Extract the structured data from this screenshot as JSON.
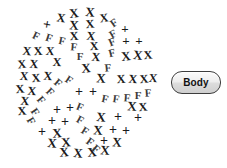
{
  "figure": {
    "name": "circular-glyph-cluster",
    "background_color": "#ffffff",
    "ink_color": "#1a1a1a",
    "cluster": {
      "center_x": 84,
      "center_y": 84,
      "radius": 74,
      "description": "circular field of hand-drawn glyphs arranged along spiral arcs"
    },
    "glyph_legend": [
      {
        "key": "x",
        "symbol": "X",
        "name": "x-glyph"
      },
      {
        "key": "p",
        "symbol": "+",
        "name": "plus-glyph"
      },
      {
        "key": "f",
        "symbol": "F",
        "name": "f-glyph"
      }
    ],
    "glyphs": [
      {
        "t": "x",
        "x": 74,
        "y": 13,
        "s": 13,
        "r": -6
      },
      {
        "t": "x",
        "x": 90,
        "y": 12,
        "s": 13,
        "r": 5
      },
      {
        "t": "x",
        "x": 61,
        "y": 18,
        "s": 12,
        "r": 8
      },
      {
        "t": "x",
        "x": 104,
        "y": 18,
        "s": 12,
        "r": -8
      },
      {
        "t": "x",
        "x": 74,
        "y": 25,
        "s": 13,
        "r": 4
      },
      {
        "t": "x",
        "x": 90,
        "y": 24,
        "s": 12,
        "r": -5
      },
      {
        "t": "p",
        "x": 47,
        "y": 25,
        "s": 14,
        "r": 10
      },
      {
        "t": "f",
        "x": 114,
        "y": 23,
        "s": 11,
        "r": -35
      },
      {
        "t": "x",
        "x": 74,
        "y": 36,
        "s": 12,
        "r": -4
      },
      {
        "t": "x",
        "x": 91,
        "y": 36,
        "s": 12,
        "r": 6
      },
      {
        "t": "f",
        "x": 113,
        "y": 34,
        "s": 11,
        "r": -30
      },
      {
        "t": "p",
        "x": 125,
        "y": 28,
        "s": 13,
        "r": 0
      },
      {
        "t": "f",
        "x": 36,
        "y": 36,
        "s": 11,
        "r": 25
      },
      {
        "t": "f",
        "x": 49,
        "y": 38,
        "s": 11,
        "r": 18
      },
      {
        "t": "f",
        "x": 62,
        "y": 41,
        "s": 11,
        "r": 12
      },
      {
        "t": "x",
        "x": 94,
        "y": 46,
        "s": 12,
        "r": -3
      },
      {
        "t": "f",
        "x": 74,
        "y": 47,
        "s": 11,
        "r": 5
      },
      {
        "t": "f",
        "x": 112,
        "y": 42,
        "s": 11,
        "r": -22
      },
      {
        "t": "p",
        "x": 126,
        "y": 40,
        "s": 13,
        "r": 0
      },
      {
        "t": "p",
        "x": 139,
        "y": 40,
        "s": 13,
        "r": 0
      },
      {
        "t": "x",
        "x": 27,
        "y": 51,
        "s": 12,
        "r": 6
      },
      {
        "t": "x",
        "x": 38,
        "y": 51,
        "s": 12,
        "r": -4
      },
      {
        "t": "x",
        "x": 50,
        "y": 51,
        "s": 12,
        "r": 4
      },
      {
        "t": "f",
        "x": 80,
        "y": 56,
        "s": 11,
        "r": 0
      },
      {
        "t": "x",
        "x": 96,
        "y": 57,
        "s": 12,
        "r": 5
      },
      {
        "t": "f",
        "x": 112,
        "y": 53,
        "s": 11,
        "r": -14
      },
      {
        "t": "x",
        "x": 126,
        "y": 56,
        "s": 13,
        "r": -6
      },
      {
        "t": "x",
        "x": 138,
        "y": 55,
        "s": 13,
        "r": 6
      },
      {
        "t": "x",
        "x": 148,
        "y": 55,
        "s": 12,
        "r": -5
      },
      {
        "t": "x",
        "x": 22,
        "y": 64,
        "s": 12,
        "r": -6
      },
      {
        "t": "x",
        "x": 34,
        "y": 64,
        "s": 12,
        "r": 5
      },
      {
        "t": "x",
        "x": 57,
        "y": 62,
        "s": 12,
        "r": 3
      },
      {
        "t": "x",
        "x": 86,
        "y": 68,
        "s": 13,
        "r": -4
      },
      {
        "t": "f",
        "x": 108,
        "y": 68,
        "s": 11,
        "r": -6
      },
      {
        "t": "x",
        "x": 24,
        "y": 76,
        "s": 12,
        "r": 4
      },
      {
        "t": "x",
        "x": 36,
        "y": 78,
        "s": 12,
        "r": -5
      },
      {
        "t": "x",
        "x": 48,
        "y": 76,
        "s": 12,
        "r": 5
      },
      {
        "t": "x",
        "x": 101,
        "y": 78,
        "s": 13,
        "r": 4
      },
      {
        "t": "x",
        "x": 121,
        "y": 79,
        "s": 12,
        "r": -4
      },
      {
        "t": "x",
        "x": 133,
        "y": 79,
        "s": 12,
        "r": 5
      },
      {
        "t": "x",
        "x": 144,
        "y": 79,
        "s": 12,
        "r": -5
      },
      {
        "t": "x",
        "x": 153,
        "y": 78,
        "s": 12,
        "r": 4
      },
      {
        "t": "f",
        "x": 58,
        "y": 83,
        "s": 11,
        "r": 40
      },
      {
        "t": "f",
        "x": 69,
        "y": 80,
        "s": 11,
        "r": 34
      },
      {
        "t": "x",
        "x": 20,
        "y": 89,
        "s": 12,
        "r": -5
      },
      {
        "t": "x",
        "x": 32,
        "y": 91,
        "s": 12,
        "r": 5
      },
      {
        "t": "f",
        "x": 50,
        "y": 92,
        "s": 11,
        "r": 45
      },
      {
        "t": "p",
        "x": 79,
        "y": 92,
        "s": 14,
        "r": 0
      },
      {
        "t": "p",
        "x": 93,
        "y": 92,
        "s": 14,
        "r": 0
      },
      {
        "t": "x",
        "x": 25,
        "y": 101,
        "s": 12,
        "r": 5
      },
      {
        "t": "f",
        "x": 41,
        "y": 100,
        "s": 11,
        "r": 50
      },
      {
        "t": "f",
        "x": 105,
        "y": 99,
        "s": 11,
        "r": 12
      },
      {
        "t": "f",
        "x": 116,
        "y": 99,
        "s": 11,
        "r": 8
      },
      {
        "t": "f",
        "x": 127,
        "y": 98,
        "s": 11,
        "r": 4
      },
      {
        "t": "f",
        "x": 138,
        "y": 95,
        "s": 11,
        "r": 0
      },
      {
        "t": "f",
        "x": 148,
        "y": 93,
        "s": 11,
        "r": -4
      },
      {
        "t": "x",
        "x": 22,
        "y": 111,
        "s": 12,
        "r": -5
      },
      {
        "t": "f",
        "x": 35,
        "y": 112,
        "s": 11,
        "r": 55
      },
      {
        "t": "p",
        "x": 57,
        "y": 110,
        "s": 14,
        "r": 0
      },
      {
        "t": "p",
        "x": 70,
        "y": 108,
        "s": 14,
        "r": 0
      },
      {
        "t": "f",
        "x": 80,
        "y": 107,
        "s": 11,
        "r": 22
      },
      {
        "t": "x",
        "x": 132,
        "y": 106,
        "s": 13,
        "r": 4
      },
      {
        "t": "x",
        "x": 143,
        "y": 107,
        "s": 12,
        "r": -5
      },
      {
        "t": "f",
        "x": 31,
        "y": 121,
        "s": 11,
        "r": 60
      },
      {
        "t": "p",
        "x": 52,
        "y": 121,
        "s": 14,
        "r": 0
      },
      {
        "t": "p",
        "x": 65,
        "y": 122,
        "s": 14,
        "r": 0
      },
      {
        "t": "x",
        "x": 101,
        "y": 117,
        "s": 13,
        "r": 5
      },
      {
        "t": "p",
        "x": 118,
        "y": 117,
        "s": 14,
        "r": 0
      },
      {
        "t": "p",
        "x": 138,
        "y": 118,
        "s": 14,
        "r": 0
      },
      {
        "t": "f",
        "x": 80,
        "y": 120,
        "s": 11,
        "r": 28
      },
      {
        "t": "p",
        "x": 42,
        "y": 132,
        "s": 14,
        "r": 0
      },
      {
        "t": "x",
        "x": 57,
        "y": 133,
        "s": 13,
        "r": -4
      },
      {
        "t": "x",
        "x": 98,
        "y": 130,
        "s": 13,
        "r": 4
      },
      {
        "t": "p",
        "x": 113,
        "y": 130,
        "s": 14,
        "r": 0
      },
      {
        "t": "p",
        "x": 126,
        "y": 131,
        "s": 14,
        "r": 0
      },
      {
        "t": "f",
        "x": 85,
        "y": 131,
        "s": 11,
        "r": 32
      },
      {
        "t": "x",
        "x": 52,
        "y": 143,
        "s": 13,
        "r": 5
      },
      {
        "t": "x",
        "x": 66,
        "y": 142,
        "s": 13,
        "r": -5
      },
      {
        "t": "p",
        "x": 104,
        "y": 141,
        "s": 14,
        "r": 0
      },
      {
        "t": "x",
        "x": 117,
        "y": 142,
        "s": 13,
        "r": 4
      },
      {
        "t": "f",
        "x": 90,
        "y": 142,
        "s": 11,
        "r": 36
      },
      {
        "t": "x",
        "x": 64,
        "y": 152,
        "s": 13,
        "r": -4
      },
      {
        "t": "x",
        "x": 78,
        "y": 153,
        "s": 13,
        "r": 5
      },
      {
        "t": "x",
        "x": 92,
        "y": 152,
        "s": 13,
        "r": -4
      },
      {
        "t": "x",
        "x": 105,
        "y": 150,
        "s": 13,
        "r": 4
      },
      {
        "t": "f",
        "x": 96,
        "y": 149,
        "s": 11,
        "r": 40
      }
    ]
  },
  "controls": {
    "body_button": {
      "label": "Body",
      "name": "body-button",
      "border_color": "#3d3d3d",
      "fill_color": "#e8e8e8",
      "text_color": "#111111"
    }
  }
}
